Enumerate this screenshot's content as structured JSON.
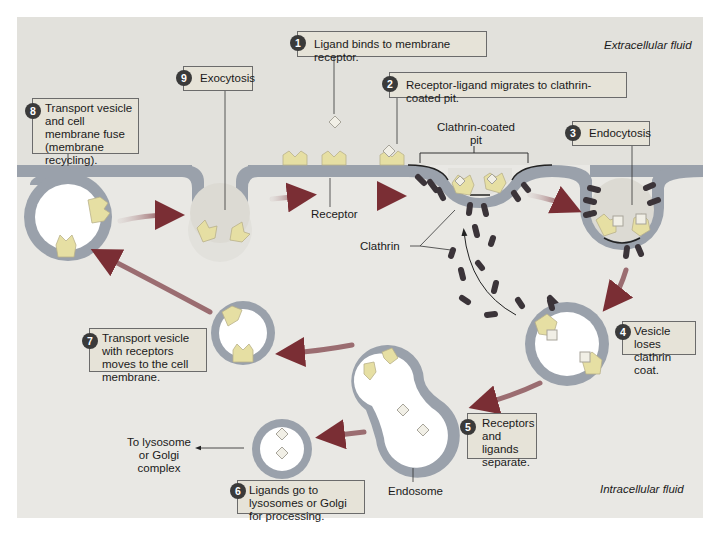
{
  "regions": {
    "extracellular": "Extracellular fluid",
    "intracellular": "Intracellular fluid"
  },
  "steps": [
    {
      "n": "1",
      "text": "Ligand binds to membrane receptor."
    },
    {
      "n": "2",
      "text": "Receptor-ligand migrates to clathrin-coated pit."
    },
    {
      "n": "3",
      "text": "Endocytosis"
    },
    {
      "n": "4",
      "text": "Vesicle loses clathrin coat."
    },
    {
      "n": "5",
      "text": "Receptors and ligands separate."
    },
    {
      "n": "6",
      "text": "Ligands go to lysosomes or Golgi for processing."
    },
    {
      "n": "7",
      "text": "Transport vesicle with receptors moves to the cell membrane."
    },
    {
      "n": "8",
      "text": "Transport vesicle and cell membrane fuse (membrane recycling)."
    },
    {
      "n": "9",
      "text": "Exocytosis"
    }
  ],
  "labels": {
    "clathrin_pit": "Clathrin-coated pit",
    "receptor": "Receptor",
    "clathrin": "Clathrin",
    "endosome": "Endosome",
    "lysosome_golgi": "To lysosome or Golgi complex"
  },
  "colors": {
    "background": "#e9e8e4",
    "membrane": "#9aa1ab",
    "receptor": "#e6dfa3",
    "clathrin": "#3b3439",
    "arrow": "#8a3b3b",
    "label_box": "#e6e3d8",
    "number_circle": "#3a3a3a"
  }
}
